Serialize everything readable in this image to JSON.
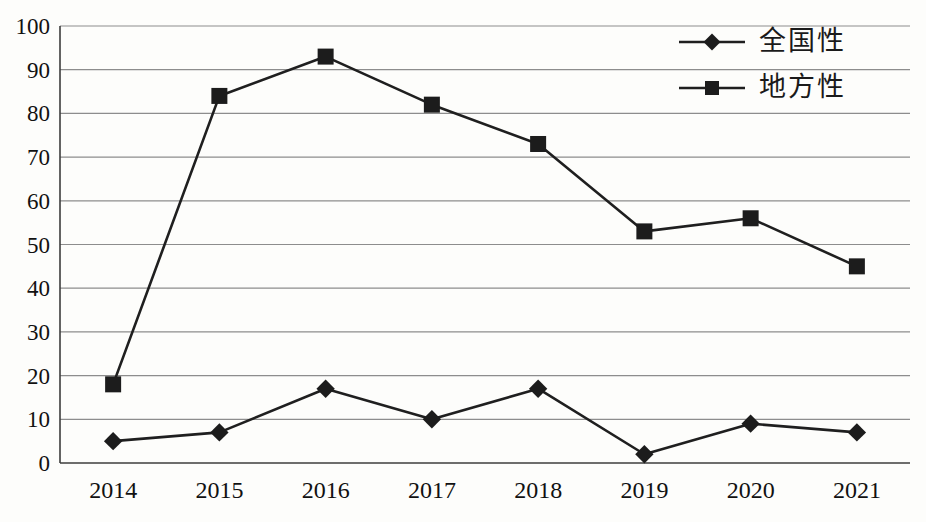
{
  "chart_data": {
    "type": "line",
    "categories": [
      "2014",
      "2015",
      "2016",
      "2017",
      "2018",
      "2019",
      "2020",
      "2021"
    ],
    "series": [
      {
        "name": "全国性",
        "marker": "diamond",
        "values": [
          5,
          7,
          17,
          10,
          17,
          2,
          9,
          7
        ]
      },
      {
        "name": "地方性",
        "marker": "square",
        "values": [
          18,
          84,
          93,
          82,
          73,
          53,
          56,
          45
        ]
      }
    ],
    "title": "",
    "xlabel": "",
    "ylabel": "",
    "ylim": [
      0,
      100
    ],
    "yticks": [
      0,
      10,
      20,
      30,
      40,
      50,
      60,
      70,
      80,
      90,
      100
    ],
    "grid": "horizontal",
    "legend_position": "top-right",
    "colors": {
      "line": "#1f1f1f",
      "marker": "#1c1c1c",
      "grid": "#8d8d8d",
      "axis": "#3c3c3c",
      "tick_text": "#111111"
    }
  }
}
